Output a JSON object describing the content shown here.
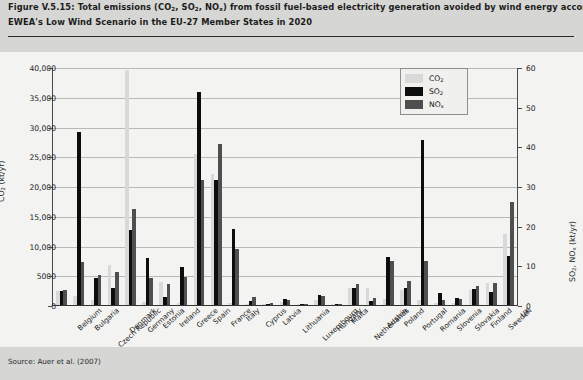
{
  "caption": {
    "line1": "Figure V.5.15: Total emissions (CO2, SO2, NOx) from fossil fuel-based electricity generation avoided by wind energy according to",
    "line2": "EWEA's Low Wind Scenario in the EU-27 Member States in 2020"
  },
  "source": "Source: Auer et al. (2007)",
  "legend": {
    "position": "top-right",
    "items": [
      {
        "label": "CO2",
        "color": "#d9d9d9"
      },
      {
        "label": "SO2",
        "color": "#0d0d0d"
      },
      {
        "label": "NOx",
        "color": "#4f4f4f"
      }
    ]
  },
  "axes": {
    "left": {
      "label": "CO2 (kt/yr)",
      "ticks": [
        "0",
        "5000",
        "10,000",
        "15,000",
        "20,000",
        "25,000",
        "30,000",
        "35,000",
        "40,000"
      ],
      "min": 0,
      "max": 40000,
      "step": 5000
    },
    "right": {
      "label": "SO2, NOx (kt/yr)",
      "ticks": [
        "0",
        "10",
        "20",
        "30",
        "40",
        "50",
        "60"
      ],
      "min": 0,
      "max": 60,
      "step": 10
    }
  },
  "chart_data": {
    "type": "bar",
    "title": "Figure V.5.15: Total emissions (CO2, SO2, NOx) from fossil fuel-based electricity generation avoided by wind energy according to EWEA's Low Wind Scenario in the EU-27 Member States in 2020",
    "xlabel": "",
    "ylabel": "CO2 (kt/yr)",
    "ylabel_secondary": "SO2, NOx (kt/yr)",
    "ylim": [
      0,
      40000
    ],
    "ylim_secondary": [
      0,
      60
    ],
    "grid": true,
    "legend_position": "top-right",
    "categories": [
      "Belgium",
      "Bulgaria",
      "Czech Republic",
      "Denmark",
      "Germany",
      "Estonia",
      "Ireland",
      "Greece",
      "Spain",
      "France",
      "Italy",
      "Cyprus",
      "Latvia",
      "Lithuania",
      "Luxembourg",
      "Hungary",
      "Malta",
      "Netherlands",
      "Austria",
      "Poland",
      "Portugal",
      "Romania",
      "Slovenia",
      "Slovakia",
      "Finland",
      "Sweden",
      "UK"
    ],
    "series": [
      {
        "name": "CO2",
        "axis": "left",
        "unit": "kt/yr",
        "color": "#d9d9d9",
        "values": [
          2400,
          1500,
          900,
          6800,
          39500,
          500,
          3800,
          400,
          25300,
          22000,
          300,
          200,
          100,
          500,
          100,
          900,
          100,
          2900,
          2900,
          1000,
          2500,
          900,
          300,
          400,
          2600,
          3700,
          12000
        ]
      },
      {
        "name": "SO2",
        "axis": "right",
        "unit": "kt/yr",
        "color": "#0d0d0d",
        "values": [
          3.6,
          43.6,
          6.8,
          4.4,
          19.0,
          11.8,
          2.0,
          9.6,
          53.8,
          31.5,
          19.2,
          0.9,
          0.3,
          1.5,
          0.2,
          2.6,
          0.2,
          4.2,
          0.9,
          12.1,
          4.2,
          41.5,
          3.1,
          1.8,
          4.1,
          3.4,
          12.4
        ]
      },
      {
        "name": "NOx",
        "axis": "right",
        "unit": "kt/yr",
        "color": "#4f4f4f",
        "values": [
          3.7,
          10.9,
          7.5,
          8.4,
          24.3,
          6.9,
          5.4,
          7.0,
          31.5,
          40.7,
          14.2,
          2.0,
          0.5,
          1.2,
          0.2,
          2.3,
          0.2,
          5.3,
          1.8,
          11.2,
          6.1,
          11.0,
          1.2,
          1.6,
          4.9,
          5.5,
          26.0
        ]
      }
    ]
  }
}
